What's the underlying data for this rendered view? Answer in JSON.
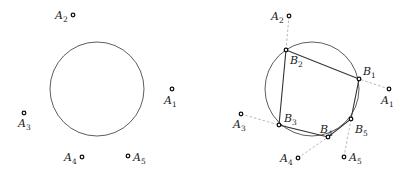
{
  "panels": [
    {
      "name": "left",
      "circle": {
        "cx": 97,
        "cy": 89,
        "r": 47
      },
      "points": [
        {
          "id": "A1",
          "label": "A",
          "sub": "1",
          "x": 172,
          "y": 89,
          "lx": 164,
          "ly": 104
        },
        {
          "id": "A2",
          "label": "A",
          "sub": "2",
          "x": 73,
          "y": 15,
          "lx": 55,
          "ly": 19
        },
        {
          "id": "A3",
          "label": "A",
          "sub": "3",
          "x": 24,
          "y": 113,
          "lx": 18,
          "ly": 127
        },
        {
          "id": "A4",
          "label": "A",
          "sub": "4",
          "x": 82,
          "y": 157,
          "lx": 64,
          "ly": 161
        },
        {
          "id": "A5",
          "label": "A",
          "sub": "5",
          "x": 128,
          "y": 156,
          "lx": 133,
          "ly": 161
        }
      ]
    },
    {
      "name": "right",
      "circle": {
        "cx": 312,
        "cy": 89,
        "r": 47
      },
      "points": [
        {
          "id": "A1",
          "label": "A",
          "sub": "1",
          "x": 389,
          "y": 89,
          "lx": 381,
          "ly": 104
        },
        {
          "id": "A2",
          "label": "A",
          "sub": "2",
          "x": 289,
          "y": 16,
          "lx": 271,
          "ly": 20
        },
        {
          "id": "A3",
          "label": "A",
          "sub": "3",
          "x": 241,
          "y": 114,
          "lx": 233,
          "ly": 128
        },
        {
          "id": "A4",
          "label": "A",
          "sub": "4",
          "x": 298,
          "y": 158,
          "lx": 280,
          "ly": 162
        },
        {
          "id": "A5",
          "label": "A",
          "sub": "5",
          "x": 344,
          "y": 157,
          "lx": 349,
          "ly": 161
        }
      ],
      "bpoints": [
        {
          "id": "B1",
          "label": "B",
          "sub": "1",
          "x": 359,
          "y": 79,
          "lx": 363,
          "ly": 75
        },
        {
          "id": "B2",
          "label": "B",
          "sub": "2",
          "x": 286,
          "y": 50,
          "lx": 290,
          "ly": 64
        },
        {
          "id": "B3",
          "label": "B",
          "sub": "3",
          "x": 279,
          "y": 125,
          "lx": 284,
          "ly": 122
        },
        {
          "id": "B4",
          "label": "B",
          "sub": "4",
          "x": 328,
          "y": 137,
          "lx": 320,
          "ly": 133
        },
        {
          "id": "B5",
          "label": "B",
          "sub": "5",
          "x": 351,
          "y": 119,
          "lx": 355,
          "ly": 133
        }
      ],
      "polygon_order": [
        "B1",
        "B2",
        "B3",
        "B4",
        "B5"
      ],
      "dashed_pairs": [
        [
          "A1",
          "B1"
        ],
        [
          "A2",
          "B2"
        ],
        [
          "A3",
          "B3"
        ],
        [
          "A4",
          "B4"
        ],
        [
          "A5",
          "B5"
        ]
      ]
    }
  ],
  "colors": {
    "stroke": "#333333",
    "dash": "#999999",
    "label": "#222222"
  }
}
